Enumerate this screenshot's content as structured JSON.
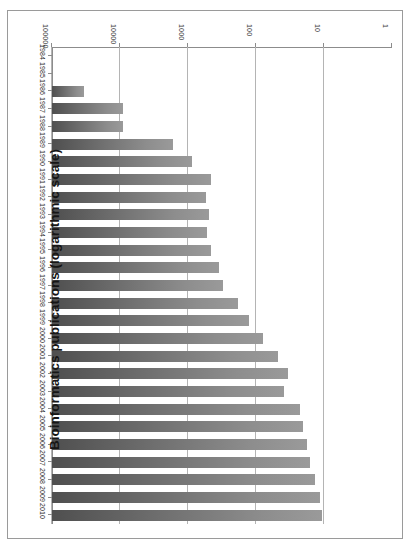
{
  "chart_data": {
    "type": "bar",
    "orientation": "horizontal",
    "title": "Bioinformatics publications (logarithmic scale)",
    "xlabel": "",
    "ylabel": "",
    "scale": "log",
    "grid": true,
    "legend": "none",
    "xlim": [
      1,
      100000
    ],
    "xticks": [
      1,
      10,
      100,
      1000,
      10000,
      100000
    ],
    "xtick_labels": [
      "1",
      "10",
      "100",
      "1000",
      "10000",
      "100000"
    ],
    "categories": [
      "1984",
      "1985",
      "1986",
      "1987",
      "1988",
      "1989",
      "1990",
      "1991",
      "1992",
      "1993",
      "1994",
      "1995",
      "1996",
      "1997",
      "1998",
      "1999",
      "2000",
      "2001",
      "2002",
      "2003",
      "2004",
      "2005",
      "2006",
      "2007",
      "2008",
      "2009",
      "2010"
    ],
    "values": [
      1,
      1,
      3,
      11,
      11,
      60,
      115,
      220,
      185,
      205,
      190,
      220,
      290,
      330,
      540,
      800,
      1250,
      2100,
      3000,
      2600,
      4400,
      4900,
      5600,
      6200,
      7400,
      8600,
      9200
    ]
  },
  "axis": {
    "value_axis_name": "publication-count-log-axis",
    "category_axis_name": "year-axis"
  },
  "colors": {
    "bar_dark": "#4f4f4f",
    "bar_light": "#9a9a9a",
    "gridline": "#b4b4b4",
    "axis": "#8c8c8c",
    "frame": "#9a9a9a",
    "title": "#161616",
    "background": "#ffffff"
  }
}
